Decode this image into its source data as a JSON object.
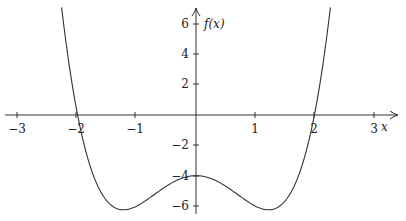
{
  "chart_data": {
    "type": "line",
    "title": "",
    "xlabel": "x",
    "ylabel": "f(x)",
    "xlim": [
      -3.2,
      3.45
    ],
    "ylim": [
      -6.6,
      7.0
    ],
    "grid": false,
    "legend": null,
    "x_ticks": [
      -3,
      -2,
      -1,
      1,
      2,
      3
    ],
    "x_tick_labels": [
      "−3",
      "−2",
      "−1",
      "1",
      "2",
      "3"
    ],
    "y_ticks": [
      6,
      4,
      2,
      -2,
      -4,
      -6
    ],
    "y_tick_labels": [
      "6",
      "4",
      "2",
      "−2",
      "−4",
      "−6"
    ],
    "series": [
      {
        "name": "f(x)",
        "function": "x^4 - 3x^2 - 4",
        "domain": [
          -2.27,
          2.27
        ],
        "x": [
          -2.27,
          -2.0,
          -1.5,
          -1.22,
          -1.0,
          -0.5,
          0,
          0.5,
          1.0,
          1.22,
          1.5,
          2.0,
          2.27
        ],
        "values": [
          6.1,
          0,
          -5.69,
          -6.25,
          -6.0,
          -4.69,
          -4.0,
          -4.69,
          -6.0,
          -6.25,
          -5.69,
          0,
          6.1
        ]
      }
    ],
    "annotations": {
      "x_intercepts": [
        -2,
        2
      ],
      "y_intercept": -4,
      "local_minima": [
        [
          -1.22,
          -6.25
        ],
        [
          1.22,
          -6.25
        ]
      ],
      "local_maximum": [
        0,
        -4
      ]
    }
  },
  "labels": {
    "x_axis": "x",
    "y_axis": "f(x)",
    "x_ticks": [
      "−3",
      "−2",
      "−1",
      "1",
      "2",
      "3"
    ],
    "y_ticks": [
      "6",
      "4",
      "2",
      "−2",
      "−4",
      "−6"
    ]
  }
}
